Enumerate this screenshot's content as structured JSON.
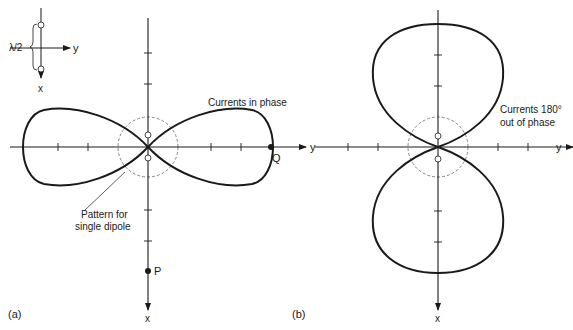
{
  "figure": {
    "panel_a": {
      "label": "(a)",
      "annotation_phase": "Currents in phase",
      "annotation_single_line1": "Pattern for",
      "annotation_single_line2": "single dipole",
      "axis_y_label": "y",
      "axis_x_label": "x",
      "point_q_label": "Q",
      "point_p_label": "P"
    },
    "panel_b": {
      "label": "(b)",
      "annotation_line1": "Currents 180°",
      "annotation_line2": "out of phase",
      "axis_y_label": "y",
      "axis_x_label": "x"
    },
    "inset": {
      "spacing_label": "λ/2",
      "axis_y_label": "y",
      "axis_x_label": "x"
    }
  },
  "colors": {
    "line": "#1a1a1a",
    "dashed": "#777777",
    "background": "#ffffff"
  }
}
